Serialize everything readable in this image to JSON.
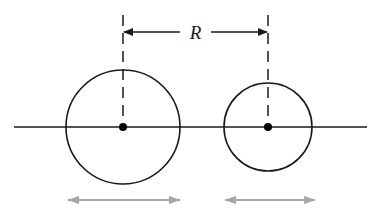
{
  "diagram": {
    "label": "R",
    "colors": {
      "ink": "#1a1a1a",
      "gray_arrow": "#a6a6a6",
      "background": "#ffffff"
    },
    "axis": {
      "x1": 14,
      "x2": 367,
      "y": 127
    },
    "bodies": [
      {
        "name": "large-circle",
        "cx": 123,
        "cy": 127,
        "r": 57
      },
      {
        "name": "small-circle",
        "cx": 268,
        "cy": 127,
        "r": 44
      }
    ],
    "distance_marker": {
      "y": 32,
      "x1": 123,
      "x2": 268,
      "text": "R"
    },
    "velocity_arrows": [
      {
        "x1": 68,
        "x2": 180,
        "y": 200
      },
      {
        "x1": 225,
        "x2": 315,
        "y": 200
      }
    ]
  }
}
